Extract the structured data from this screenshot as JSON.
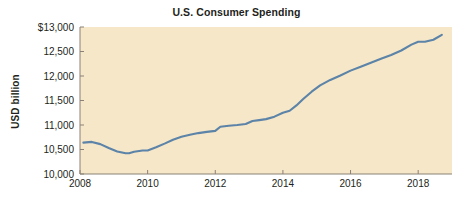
{
  "chart_data": {
    "type": "line",
    "title": "U.S. Consumer Spending",
    "xlabel": "",
    "ylabel": "USD billion",
    "xlim": [
      2008,
      2019
    ],
    "ylim": [
      10000,
      13000
    ],
    "xticks": [
      "2008",
      "2010",
      "2012",
      "2014",
      "2016",
      "2018"
    ],
    "xtick_values": [
      2008,
      2010,
      2012,
      2014,
      2016,
      2018
    ],
    "yticks": [
      "10,000",
      "10,500",
      "11,000",
      "11,500",
      "12,000",
      "12,500",
      "$13,000"
    ],
    "ytick_values": [
      10000,
      10500,
      11000,
      11500,
      12000,
      12500,
      13000
    ],
    "grid": false,
    "legend": false,
    "series": [
      {
        "name": "U.S. Consumer Spending",
        "color": "#5c83a8",
        "x": [
          2008.1,
          2008.35,
          2008.6,
          2008.85,
          2009.1,
          2009.35,
          2009.45,
          2009.6,
          2009.85,
          2010.0,
          2010.25,
          2010.5,
          2010.75,
          2011.0,
          2011.25,
          2011.5,
          2011.75,
          2012.0,
          2012.15,
          2012.4,
          2012.65,
          2012.9,
          2013.1,
          2013.3,
          2013.5,
          2013.75,
          2014.0,
          2014.2,
          2014.4,
          2014.6,
          2014.85,
          2015.1,
          2015.4,
          2015.7,
          2016.0,
          2016.3,
          2016.6,
          2016.9,
          2017.2,
          2017.5,
          2017.8,
          2018.0,
          2018.2,
          2018.45,
          2018.7
        ],
        "y": [
          10640,
          10655,
          10610,
          10530,
          10460,
          10425,
          10425,
          10455,
          10480,
          10480,
          10545,
          10620,
          10700,
          10760,
          10800,
          10835,
          10860,
          10880,
          10965,
          10985,
          11000,
          11020,
          11080,
          11100,
          11120,
          11170,
          11250,
          11290,
          11400,
          11530,
          11680,
          11810,
          11920,
          12010,
          12110,
          12190,
          12270,
          12350,
          12430,
          12520,
          12640,
          12700,
          12700,
          12740,
          12840
        ]
      }
    ]
  },
  "plot_style": {
    "plot_background": "#f6e7c8",
    "axis_color": "#8a8177",
    "line_color": "#5c83a8",
    "text_color": "#231f20",
    "figure_background": "#ffffff"
  }
}
